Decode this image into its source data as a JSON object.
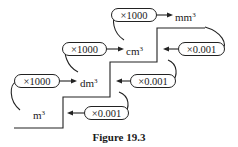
{
  "diagram": {
    "type": "unit-conversion-staircase",
    "units": [
      {
        "base": "m",
        "exp": "3"
      },
      {
        "base": "dm",
        "exp": "3"
      },
      {
        "base": "cm",
        "exp": "3"
      },
      {
        "base": "mm",
        "exp": "3"
      }
    ],
    "multiply_up": [
      "×1000",
      "×1000",
      "×1000"
    ],
    "multiply_down": [
      "×0.001",
      "×0.001",
      "×0.001"
    ],
    "caption": "Figure 19.3"
  }
}
